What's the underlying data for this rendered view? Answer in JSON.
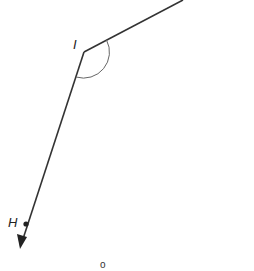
{
  "diagram": {
    "type": "geometry-angle",
    "vertex": {
      "label": "I",
      "x": 84,
      "y": 52
    },
    "rays": [
      {
        "name": "upper-ray",
        "from": [
          84,
          52
        ],
        "to": [
          183,
          0
        ]
      },
      {
        "name": "lower-ray",
        "from": [
          84,
          52
        ],
        "to": [
          20,
          248
        ],
        "arrow": true
      }
    ],
    "points": [
      {
        "label": "H",
        "x": 26,
        "y": 224
      }
    ],
    "angle_arc": {
      "center": [
        84,
        52
      ],
      "radius": 26
    },
    "extra_point": {
      "label": "o",
      "x": 104,
      "y": 264
    },
    "colors": {
      "line": "#333333",
      "arc": "#666666"
    }
  }
}
